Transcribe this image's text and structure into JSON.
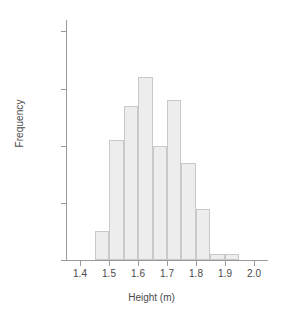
{
  "chart_data": {
    "type": "bar",
    "title": "",
    "xlabel": "Height (m)",
    "ylabel": "Frequency",
    "grid": false,
    "legend": false,
    "bin_width": 0.05,
    "xlim": [
      1.35,
      2.05
    ],
    "ylim": [
      0,
      42
    ],
    "xticks": [
      "1.4",
      "1.5",
      "1.6",
      "1.7",
      "1.8",
      "1.9",
      "2.0"
    ],
    "xtick_values": [
      1.4,
      1.5,
      1.6,
      1.7,
      1.8,
      1.9,
      2.0
    ],
    "yticks": [
      "0",
      "10",
      "20",
      "30",
      "40"
    ],
    "ytick_values": [
      0,
      10,
      20,
      30,
      40
    ],
    "bin_edges": [
      1.45,
      1.5,
      1.55,
      1.6,
      1.65,
      1.7,
      1.75,
      1.8,
      1.85,
      1.9,
      1.95
    ],
    "categories": [
      "1.45-1.50",
      "1.50-1.55",
      "1.55-1.60",
      "1.60-1.65",
      "1.65-1.70",
      "1.70-1.75",
      "1.75-1.80",
      "1.80-1.85",
      "1.85-1.90",
      "1.90-1.95"
    ],
    "values": [
      5,
      21,
      27,
      32,
      20,
      28,
      17,
      9,
      1,
      1
    ],
    "colors": {
      "bar_fill": "#ededed",
      "bar_edge": "#c9c9c9",
      "axis": "#9a9a9a",
      "text": "#4a4a4a",
      "background": "#ffffff"
    }
  }
}
